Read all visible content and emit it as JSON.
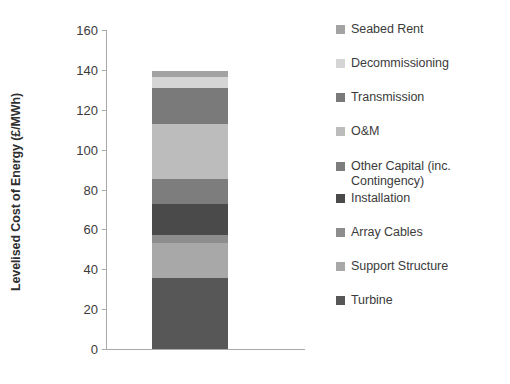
{
  "chart_data": {
    "type": "bar",
    "title": "",
    "subtitle": "",
    "xlabel": "",
    "ylabel": "Levelised Cost of Energy (£/MWh)",
    "ylim": [
      0,
      160
    ],
    "yticks": [
      0,
      20,
      40,
      60,
      80,
      100,
      120,
      140,
      160
    ],
    "ytick_labels": [
      "0",
      "20",
      "40",
      "60",
      "80",
      "100",
      "120",
      "140",
      "160"
    ],
    "grid": false,
    "legend_position": "right",
    "stacked": true,
    "categories": [
      ""
    ],
    "total": 139.5,
    "series": [
      {
        "name": "Turbine",
        "values": [
          35.5
        ],
        "color": "#575757"
      },
      {
        "name": "Support Structure",
        "values": [
          17.5
        ],
        "color": "#a8a8a8"
      },
      {
        "name": "Array Cables",
        "values": [
          4.0
        ],
        "color": "#8d8d8d"
      },
      {
        "name": "Installation",
        "values": [
          15.5
        ],
        "color": "#4a4a4a"
      },
      {
        "name": "Other Capital (inc. Contingency)",
        "values": [
          13.0
        ],
        "color": "#7d7d7d"
      },
      {
        "name": "O&M",
        "values": [
          27.5
        ],
        "color": "#bcbcbc"
      },
      {
        "name": "Transmission",
        "values": [
          18.0
        ],
        "color": "#7a7a7a"
      },
      {
        "name": "Decommissioning",
        "values": [
          5.5
        ],
        "color": "#d5d5d5"
      },
      {
        "name": "Seabed Rent",
        "values": [
          3.0
        ],
        "color": "#a3a3a3"
      }
    ]
  },
  "legend": {
    "items": [
      {
        "label": "Seabed Rent",
        "color": "#a3a3a3"
      },
      {
        "label": "Decommissioning",
        "color": "#d5d5d5"
      },
      {
        "label": "Transmission",
        "color": "#7a7a7a"
      },
      {
        "label": "O&M",
        "color": "#bcbcbc"
      },
      {
        "label": "Other Capital (inc. Contingency)",
        "color": "#7d7d7d"
      },
      {
        "label": "Installation",
        "color": "#4a4a4a"
      },
      {
        "label": "Array Cables",
        "color": "#8d8d8d"
      },
      {
        "label": "Support Structure",
        "color": "#a8a8a8"
      },
      {
        "label": "Turbine",
        "color": "#575757"
      }
    ]
  }
}
